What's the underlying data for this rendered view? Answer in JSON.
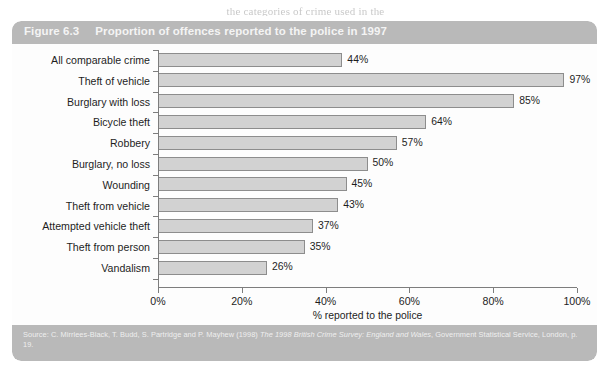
{
  "page": {
    "top_text_sliver": "the categories of crime used in the"
  },
  "figure": {
    "number": "Figure 6.3",
    "title": "Proportion of offences reported to the police in 1997",
    "source_prefix": "Source: C. Mirrlees-Black, T. Budd, S. Partridge and P. Mayhew (1998) ",
    "source_italic": "The 1998 British Crime Survey: England and Wales",
    "source_suffix": ", Government Statistical Service, London, p. 19."
  },
  "colors": {
    "header_band": "#b9b9b9",
    "bar_fill": "#d2d2d2",
    "bar_border": "#8d8d8d",
    "axis": "#7d7d7d",
    "panel_bg": "#fdfdfd",
    "header_text": "#f4f4f4"
  },
  "chart_data": {
    "type": "bar",
    "orientation": "horizontal",
    "title": "Proportion of offences reported to the police in 1997",
    "xlabel": "% reported to the police",
    "ylabel": "",
    "xlim": [
      0,
      100
    ],
    "xticks": [
      0,
      20,
      40,
      60,
      80,
      100
    ],
    "xtick_labels": [
      "0%",
      "20%",
      "40%",
      "60%",
      "80%",
      "100%"
    ],
    "grid": false,
    "legend": false,
    "categories": [
      "All comparable crime",
      "Theft of vehicle",
      "Burglary with loss",
      "Bicycle theft",
      "Robbery",
      "Burglary, no loss",
      "Wounding",
      "Theft from vehicle",
      "Attempted vehicle theft",
      "Theft from person",
      "Vandalism"
    ],
    "values": [
      44,
      97,
      85,
      64,
      57,
      50,
      45,
      43,
      37,
      35,
      26
    ],
    "data_labels": [
      "44%",
      "97%",
      "85%",
      "64%",
      "57%",
      "50%",
      "45%",
      "43%",
      "37%",
      "35%",
      "26%"
    ]
  }
}
